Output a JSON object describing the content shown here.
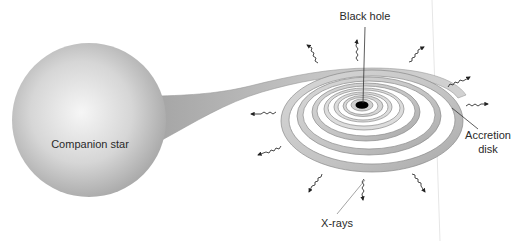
{
  "diagram": {
    "labels": {
      "companion_star": "Companion star",
      "black_hole": "Black hole",
      "accretion_disk_line1": "Accretion",
      "accretion_disk_line2": "disk",
      "x_rays": "X-rays"
    },
    "colors": {
      "background": "#ffffff",
      "star_light": "#f4f4f4",
      "star_dark": "#a8a8a8",
      "stream": "#b8b8b8",
      "disk_band": "#c4c4c4",
      "disk_stroke": "#8a8a8a",
      "black_hole": "#000000",
      "arrows": "#333333",
      "leader_lines": "#444444"
    },
    "elements": [
      {
        "name": "companion-star",
        "shape": "sphere"
      },
      {
        "name": "mass-transfer-stream",
        "shape": "tapered-stream"
      },
      {
        "name": "accretion-disk",
        "shape": "spiral-rings"
      },
      {
        "name": "black-hole",
        "shape": "ellipse"
      },
      {
        "name": "x-ray-emissions",
        "count": 11,
        "shape": "wavy-arrows"
      }
    ]
  }
}
